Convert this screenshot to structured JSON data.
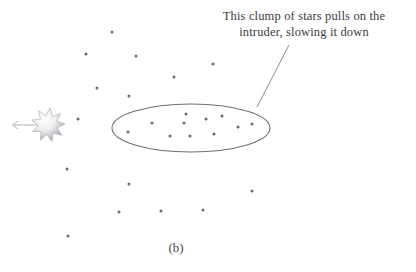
{
  "figure": {
    "caption": "(b)",
    "background_color": "#ffffff",
    "annotation": {
      "line1": "This clump of stars pulls on the",
      "line2": "intruder, slowing it down",
      "color": "#3b3b3f",
      "leader_line": {
        "name": "leader-line",
        "x1": 289,
        "y1": 45,
        "x2": 257,
        "y2": 107,
        "color": "#8d8d94"
      }
    },
    "intruder_star": {
      "name": "intruder-star",
      "cx": 48,
      "cy": 125,
      "outer_radius": 17,
      "inner_radius": 9.5,
      "points": 9,
      "fill_light": "#fcfcfc",
      "fill_dark": "#9a9aa1",
      "stroke": "#b5b5bb"
    },
    "velocity_arrow": {
      "name": "velocity-arrow",
      "x_tail": 40,
      "x_head": 12,
      "y": 125,
      "color": "#a8a8ae",
      "head_size": 4
    },
    "clump_ellipse": {
      "name": "clump-ellipse",
      "cx": 191,
      "cy": 128,
      "rx": 79,
      "ry": 24,
      "stroke": "#6f6f77",
      "stroke_width": 1.1,
      "fill": "none"
    },
    "star_color": "#6b6b73",
    "star_radius": 1.5,
    "clump_stars": [
      {
        "x": 128,
        "y": 132
      },
      {
        "x": 152,
        "y": 123
      },
      {
        "x": 170,
        "y": 136
      },
      {
        "x": 184,
        "y": 123
      },
      {
        "x": 186,
        "y": 114
      },
      {
        "x": 190,
        "y": 136
      },
      {
        "x": 206,
        "y": 119
      },
      {
        "x": 214,
        "y": 134
      },
      {
        "x": 222,
        "y": 116
      },
      {
        "x": 238,
        "y": 127
      },
      {
        "x": 252,
        "y": 124
      }
    ],
    "field_stars": [
      {
        "x": 112,
        "y": 32
      },
      {
        "x": 86,
        "y": 54
      },
      {
        "x": 136,
        "y": 56
      },
      {
        "x": 97,
        "y": 88
      },
      {
        "x": 129,
        "y": 96
      },
      {
        "x": 213,
        "y": 64
      },
      {
        "x": 174,
        "y": 77
      },
      {
        "x": 78,
        "y": 119
      },
      {
        "x": 67,
        "y": 169
      },
      {
        "x": 129,
        "y": 184
      },
      {
        "x": 119,
        "y": 212
      },
      {
        "x": 68,
        "y": 236
      },
      {
        "x": 252,
        "y": 191
      },
      {
        "x": 161,
        "y": 211
      },
      {
        "x": 203,
        "y": 210
      }
    ]
  }
}
